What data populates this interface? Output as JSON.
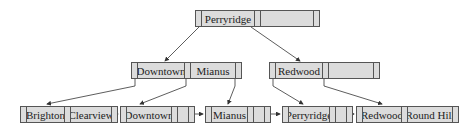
{
  "diagram": {
    "type": "B+ tree",
    "colors": {
      "node_fill": "#dcdcdc",
      "border": "#555555",
      "arrow": "#333333"
    },
    "root": {
      "keys": [
        "Perryridge",
        ""
      ]
    },
    "internal": [
      {
        "keys": [
          "Downtown",
          "Mianus"
        ]
      },
      {
        "keys": [
          "Redwood",
          ""
        ]
      }
    ],
    "leaves": [
      {
        "keys": [
          "Brighton",
          "Clearview"
        ]
      },
      {
        "keys": [
          "Downtown",
          ""
        ]
      },
      {
        "keys": [
          "Mianus",
          ""
        ]
      },
      {
        "keys": [
          "Perryridge",
          ""
        ]
      },
      {
        "keys": [
          "Redwood",
          "Round Hill"
        ]
      }
    ]
  }
}
